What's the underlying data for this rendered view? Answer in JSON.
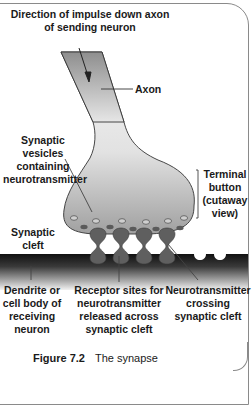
{
  "figure": {
    "title": "The synapse",
    "number": "Figure 7.2"
  },
  "labels": {
    "direction": "Direction of impulse down axon\nof sending neuron",
    "axon": "Axon",
    "vesicles": "Synaptic vesicles\ncontaining\nneurotransmitter",
    "terminal": "Terminal\nbutton\n(cutaway\nview)",
    "cleft": "Synaptic\ncleft",
    "dendrite": "Dendrite or\ncell body of\nreceiving\nneuron",
    "receptor": "Receptor sites for\nneurotransmitter\nreleased across\nsynaptic cleft",
    "crossing": "Neurotransmitter\ncrossing\nsynaptic cleft"
  },
  "colors": {
    "axon_fill": "#9a9a9a",
    "terminal_fill": "#a8a8a8",
    "receptor_fill": "#5e5e5e",
    "vesicle_fill": "#6a6a6a",
    "receiving_dark": "#222222",
    "line": "#333333"
  }
}
